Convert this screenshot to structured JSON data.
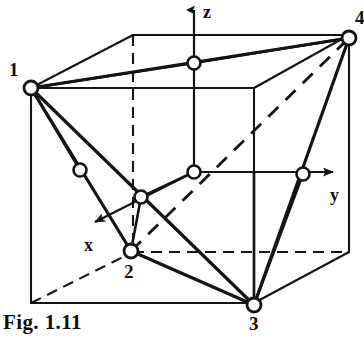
{
  "figure": {
    "caption": "Fig. 1.11",
    "ink_color": "#141414",
    "background_color": "#ffffff",
    "node_fill_color": "#ffffff",
    "vertex_labels": [
      {
        "name": "vertex-label-1",
        "text": "1",
        "x": 9,
        "y": 60
      },
      {
        "name": "vertex-label-2",
        "text": "2",
        "x": 124,
        "y": 262
      },
      {
        "name": "vertex-label-3",
        "text": "3",
        "x": 249,
        "y": 314
      },
      {
        "name": "vertex-label-4",
        "text": "4",
        "x": 355,
        "y": 8
      }
    ],
    "axis_labels": [
      {
        "name": "axis-label-z",
        "text": "z",
        "x": 203,
        "y": 3
      },
      {
        "name": "axis-label-y",
        "text": "y",
        "x": 330,
        "y": 186
      },
      {
        "name": "axis-label-x",
        "text": "x",
        "x": 84,
        "y": 236
      }
    ],
    "axes": [
      {
        "name": "z-axis",
        "from": [
          194,
          172
        ],
        "to": [
          194,
          4
        ],
        "style": "solid-arrow"
      },
      {
        "name": "y-axis",
        "from": [
          194,
          172
        ],
        "to": [
          336,
          172
        ],
        "style": "solid-arrow"
      },
      {
        "name": "x-axis",
        "from": [
          194,
          172
        ],
        "to": [
          92,
          224
        ],
        "style": "solid-arrow"
      }
    ],
    "cube_corners": {
      "front_top_left": [
        31,
        88
      ],
      "front_top_right": [
        254,
        88
      ],
      "front_bot_left": [
        31,
        303
      ],
      "front_bot_right": [
        254,
        303
      ],
      "back_top_left": [
        133,
        35
      ],
      "back_top_right": [
        349,
        35
      ],
      "back_bot_left": [
        133,
        252
      ],
      "back_bot_right": [
        349,
        252
      ]
    },
    "tetrahedron_vertices": {
      "v1": [
        31,
        88
      ],
      "v2": [
        131,
        251
      ],
      "v3": [
        254,
        305
      ],
      "v4": [
        349,
        38
      ]
    },
    "face_centers": [
      {
        "name": "face-center-left",
        "pos": [
          80,
          170
        ]
      },
      {
        "name": "face-center-top",
        "pos": [
          194,
          63
        ]
      },
      {
        "name": "face-center-middle",
        "pos": [
          194,
          172
        ]
      },
      {
        "name": "face-center-front",
        "pos": [
          141,
          197
        ]
      },
      {
        "name": "face-center-right",
        "pos": [
          303,
          174
        ]
      }
    ],
    "node_radius": 6.5
  }
}
